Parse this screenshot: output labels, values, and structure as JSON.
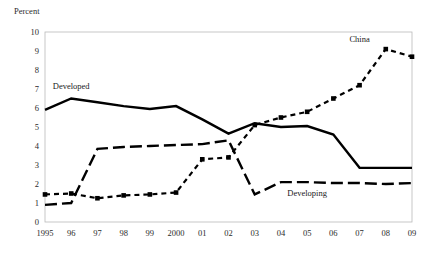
{
  "chart_data": {
    "type": "line",
    "title": "",
    "ylabel": "Percent",
    "xlabel": "",
    "ylim": [
      0,
      10
    ],
    "yticks": [
      0,
      1,
      2,
      3,
      4,
      5,
      6,
      7,
      8,
      9,
      10
    ],
    "ytick_labels": [
      "0",
      "1",
      "2",
      "3",
      "4",
      "5",
      "6",
      "7",
      "8",
      "9",
      "10"
    ],
    "grid": false,
    "legend_position": "inline-annotations",
    "categories": [
      "1995",
      "96",
      "97",
      "98",
      "99",
      "2000",
      "01",
      "02",
      "03",
      "04",
      "05",
      "06",
      "07",
      "08",
      "09"
    ],
    "series": [
      {
        "name": "Developed",
        "style": "solid",
        "markers": false,
        "label_x_category": "96",
        "label_value": 7.0,
        "values": [
          5.9,
          6.5,
          6.3,
          6.1,
          5.95,
          6.1,
          5.4,
          4.65,
          5.2,
          5.0,
          5.05,
          4.6,
          2.85,
          2.85,
          2.85
        ]
      },
      {
        "name": "Developing",
        "style": "long-dash",
        "markers": false,
        "label_x_category": "05",
        "label_value": 1.35,
        "values": [
          0.9,
          1.0,
          3.85,
          3.95,
          4.0,
          4.05,
          4.1,
          4.3,
          1.45,
          2.1,
          2.1,
          2.05,
          2.05,
          2.0,
          2.05
        ]
      },
      {
        "name": "China",
        "style": "short-dash",
        "markers": true,
        "label_x_category": "07",
        "label_value": 9.5,
        "values": [
          1.45,
          1.5,
          1.25,
          1.4,
          1.45,
          1.55,
          3.3,
          3.4,
          5.1,
          5.5,
          5.8,
          6.5,
          7.2,
          9.1,
          8.7
        ]
      }
    ]
  },
  "axis": {
    "unit_caption": "Percent"
  },
  "colors": {
    "line": "#000000",
    "frame": "#b9b9b9",
    "text": "#2b2b2b",
    "background": "#ffffff"
  }
}
